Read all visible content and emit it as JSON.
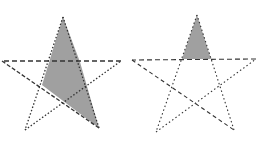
{
  "figure": {
    "colors": {
      "background": "#ffffff",
      "fill": "#a0a0a0",
      "stroke": "#333333"
    },
    "stars": [
      {
        "name": "left-star",
        "vertices": {
          "top": [
            63,
            17
          ],
          "left": [
            2,
            61
          ],
          "right": [
            121,
            61
          ],
          "bottom_left": [
            25,
            130
          ],
          "bottom_right": [
            99,
            128
          ]
        },
        "shaded_region": "long spike from top vertex to bottom-right vertex",
        "shaded_polygon": [
          [
            63,
            17
          ],
          [
            42,
            85
          ],
          [
            99,
            128
          ],
          [
            80,
            62
          ]
        ]
      },
      {
        "name": "right-star",
        "vertices": {
          "top": [
            197,
            15
          ],
          "left": [
            132,
            60
          ],
          "right": [
            256,
            59
          ],
          "bottom_left": [
            156,
            132
          ],
          "bottom_right": [
            234,
            130
          ]
        },
        "shaded_region": "top point triangle",
        "shaded_polygon": [
          [
            197,
            15
          ],
          [
            182,
            59
          ],
          [
            211,
            59
          ]
        ]
      }
    ]
  }
}
